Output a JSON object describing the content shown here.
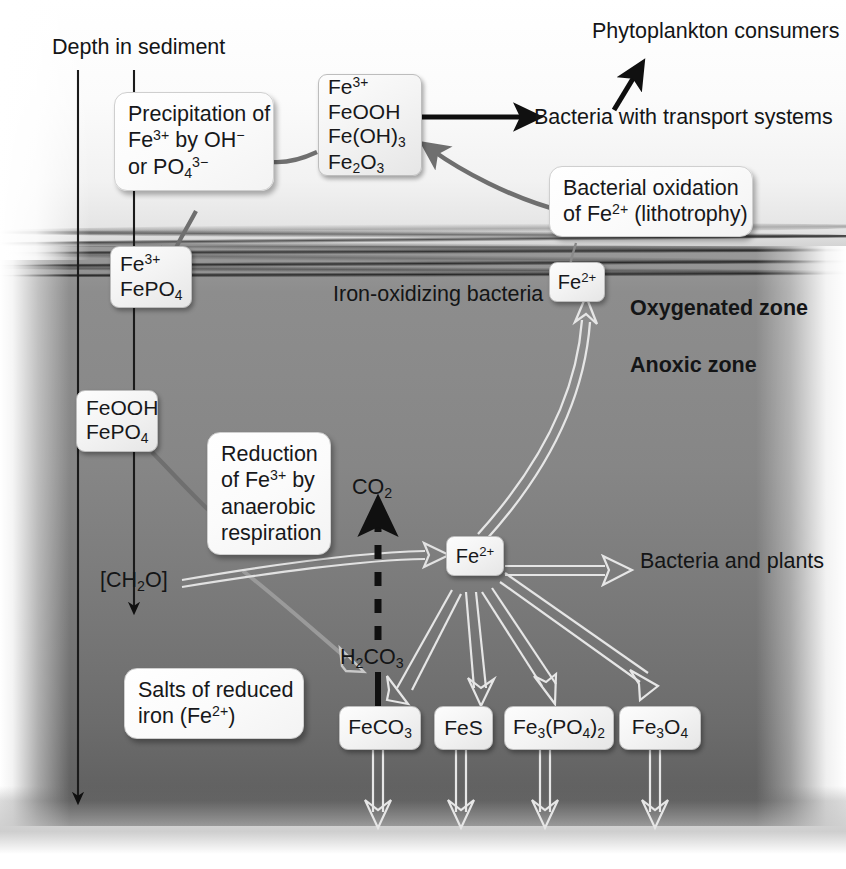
{
  "diagram": {
    "axis_label": "Depth in sediment",
    "zone_labels": {
      "oxygenated": "Oxygenated zone",
      "anoxic": "Anoxic zone",
      "interface": "Iron-oxidizing bacteria"
    },
    "colors": {
      "water": "#f2f2f2",
      "sediment_top": "#8a8a8a",
      "sediment_bottom": "#5c5c5c",
      "interface_band": "#3a3a3a",
      "node_fill": "#f0f0f0",
      "node_border": "#bdbdbd",
      "gray_arrow": "#6f6f6f",
      "white_arrow": "#e8e8e8",
      "black_arrow": "#111111"
    },
    "nodes": [
      {
        "id": "ferric-oxides",
        "lines": [
          "Fe3+",
          "FeOOH",
          "Fe(OH)3",
          "Fe2O3"
        ]
      },
      {
        "id": "fe3-fepo4",
        "lines": [
          "Fe3+",
          "FePO4"
        ]
      },
      {
        "id": "fe2-surface",
        "lines": [
          "Fe2+"
        ]
      },
      {
        "id": "feooh-fepo4",
        "lines": [
          "FeOOH",
          "FePO4"
        ]
      },
      {
        "id": "fe2-anoxic",
        "lines": [
          "Fe2+"
        ]
      },
      {
        "id": "feco3",
        "lines": [
          "FeCO3"
        ]
      },
      {
        "id": "fes",
        "lines": [
          "FeS"
        ]
      },
      {
        "id": "fe3po42",
        "lines": [
          "Fe3(PO4)2"
        ]
      },
      {
        "id": "fe3o4",
        "lines": [
          "Fe3O4"
        ]
      }
    ],
    "callouts": [
      {
        "id": "precipitation",
        "lines": [
          "Precipitation of",
          "Fe3+ by OH-",
          "or PO4 3-"
        ]
      },
      {
        "id": "bacterial-oxidation",
        "lines": [
          "Bacterial oxidation",
          "of Fe2+ (lithotrophy)"
        ]
      },
      {
        "id": "reduction",
        "lines": [
          "Reduction",
          "of Fe3+ by",
          "anaerobic",
          "respiration"
        ]
      },
      {
        "id": "salts",
        "lines": [
          "Salts of reduced",
          "iron (Fe2+)"
        ]
      }
    ],
    "free_text": {
      "phytoplankton_line1": "Phytoplankton",
      "phytoplankton_line2": "consumers",
      "bacteria_transport_line1": "Bacteria with",
      "bacteria_transport_line2": "transport systems",
      "bacteria_plants_line1": "Bacteria",
      "bacteria_plants_line2": "and plants",
      "co2": "CO2",
      "h2co3": "H2CO3",
      "ch2o": "[CH2O]"
    },
    "species": {
      "fe3_ion": "Fe",
      "fe3_charge": "3+",
      "fe2_ion": "Fe",
      "fe2_charge": "2+",
      "feooh": "FeOOH",
      "feoh3_pre": "Fe(OH)",
      "feoh3_sub": "3",
      "fe2o3_pre": "Fe",
      "fe2o3_sub1": "2",
      "fe2o3_mid": "O",
      "fe2o3_sub2": "3",
      "fepo4_pre": "FePO",
      "fepo4_sub": "4",
      "feco3_pre": "FeCO",
      "feco3_sub": "3",
      "fes": "FeS",
      "fe3po42_pre": "Fe",
      "fe3po42_sub1": "3",
      "fe3po42_mid": "(PO",
      "fe3po42_sub2": "4",
      "fe3po42_close": ")",
      "fe3po42_sub3": "2",
      "fe3o4_pre": "Fe",
      "fe3o4_sub1": "3",
      "fe3o4_mid": "O",
      "fe3o4_sub2": "4",
      "oh_minus": "OH",
      "oh_sup": "−",
      "po4_pre": "PO",
      "po4_sub": "4",
      "po4_sup": "3−",
      "co2_pre": "CO",
      "co2_sub": "2",
      "h2co3_h": "H",
      "h2co3_sub1": "2",
      "h2co3_co": "CO",
      "h2co3_sub2": "3",
      "ch2o_open": "[CH",
      "ch2o_sub": "2",
      "ch2o_close": "O]",
      "precip_l1": "Precipitation of",
      "precip_by": " by ",
      "precip_or": "or ",
      "bacox_l1": "Bacterial oxidation",
      "bacox_of": "of ",
      "bacox_litho": " (lithotrophy)",
      "red_l1": "Reduction",
      "red_of": "of ",
      "red_by": " by",
      "red_l3": "anaerobic",
      "red_l4": "respiration",
      "salts_l1": "Salts of reduced",
      "salts_l2_pre": "iron (",
      "salts_l2_post": ")"
    }
  }
}
